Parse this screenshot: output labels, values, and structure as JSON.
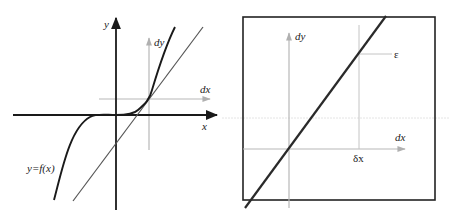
{
  "figure": {
    "left_panel": {
      "title": "Function graph with tangent line",
      "axes": {
        "x_label": "x",
        "y_label": "y"
      },
      "local_axes": {
        "x_label": "dx",
        "y_label": "dy"
      },
      "curve_label": "y=f(x)",
      "colors": {
        "axis": "#1a1a1a",
        "curve": "#1a1a1a",
        "tangent": "#555555",
        "local_axes": "#b8b8b8"
      }
    },
    "right_panel": {
      "title": "Zoomed view: curve approximately linear",
      "local_axes": {
        "x_label": "dx",
        "y_label": "dy"
      },
      "delta_label": "δx",
      "epsilon_label": "ε",
      "colors": {
        "frame": "#222222",
        "curve": "#2a2a2a",
        "local_axes": "#b8b8b8"
      }
    }
  }
}
